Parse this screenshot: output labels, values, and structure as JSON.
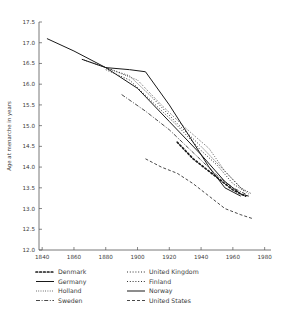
{
  "chart_data": {
    "type": "line",
    "title": "",
    "xlabel": "",
    "ylabel": "Age at menarche in years",
    "xlim": [
      1838,
      1984
    ],
    "ylim": [
      12.0,
      17.5
    ],
    "grid": false,
    "legend_position": "bottom",
    "xticks": [
      1840,
      1860,
      1880,
      1900,
      1920,
      1940,
      1960,
      1980
    ],
    "xtick_labels": [
      "1840",
      "1860",
      "1880",
      "1900",
      "1920",
      "1940",
      "1960",
      "1980"
    ],
    "yticks": [
      12.0,
      12.5,
      13.0,
      13.5,
      14.0,
      14.5,
      15.0,
      15.5,
      16.0,
      16.5,
      17.0,
      17.5
    ],
    "ytick_labels": [
      "12.0",
      "12.5",
      "13.0",
      "13.5",
      "14.0",
      "14.5",
      "15.0",
      "15.5",
      "16.0",
      "16.5",
      "17.0",
      "17.5"
    ],
    "series": [
      {
        "name": "Denmark",
        "style": "dotted-thick",
        "dash": "1.6,2.2",
        "width": 1.7,
        "x": [
          1925,
          1935,
          1945,
          1955,
          1960,
          1965,
          1968
        ],
        "values": [
          14.6,
          14.2,
          13.9,
          13.6,
          13.45,
          13.35,
          13.3
        ]
      },
      {
        "name": "Germany",
        "style": "solid",
        "dash": "none",
        "width": 1.0,
        "x": [
          1865,
          1880,
          1895,
          1905,
          1920,
          1935,
          1945,
          1955,
          1965
        ],
        "values": [
          16.6,
          16.4,
          16.35,
          16.3,
          15.5,
          14.6,
          14.0,
          13.5,
          13.3
        ]
      },
      {
        "name": "Holland",
        "style": "fine-dotted",
        "dash": "0.8,1.5",
        "width": 0.8,
        "x": [
          1865,
          1880,
          1890,
          1900,
          1915,
          1930,
          1945,
          1955,
          1965,
          1970
        ],
        "values": [
          16.6,
          16.4,
          16.25,
          16.1,
          15.5,
          14.95,
          14.45,
          13.9,
          13.5,
          13.35
        ]
      },
      {
        "name": "Sweden",
        "style": "dash-dot",
        "dash": "4,1.6,1,1.6",
        "width": 0.8,
        "x": [
          1890,
          1905,
          1920,
          1935,
          1950,
          1960,
          1968
        ],
        "values": [
          15.75,
          15.35,
          14.9,
          14.35,
          13.8,
          13.5,
          13.35
        ]
      },
      {
        "name": "United Kingdom",
        "style": "dotted",
        "dash": "1.0,1.8",
        "width": 0.9,
        "x": [
          1880,
          1895,
          1910,
          1925,
          1940,
          1955,
          1965,
          1972
        ],
        "values": [
          16.4,
          16.2,
          15.65,
          15.05,
          14.5,
          13.9,
          13.5,
          13.35
        ]
      },
      {
        "name": "Finland",
        "style": "dotted",
        "dash": "1.0,1.8",
        "width": 0.9,
        "x": [
          1880,
          1895,
          1910,
          1925,
          1940,
          1950,
          1960,
          1968
        ],
        "values": [
          16.35,
          16.1,
          15.55,
          15.0,
          14.4,
          14.05,
          13.6,
          13.4
        ]
      },
      {
        "name": "Norway",
        "style": "solid",
        "dash": "none",
        "width": 1.0,
        "x": [
          1843,
          1860,
          1880,
          1900,
          1920,
          1940,
          1955,
          1965,
          1970
        ],
        "values": [
          17.1,
          16.8,
          16.4,
          15.9,
          15.1,
          14.3,
          13.65,
          13.35,
          13.3
        ]
      },
      {
        "name": "United States",
        "style": "dashed",
        "dash": "3,2",
        "width": 0.8,
        "x": [
          1905,
          1915,
          1925,
          1935,
          1945,
          1955,
          1965,
          1973
        ],
        "values": [
          14.2,
          14.0,
          13.85,
          13.6,
          13.3,
          13.0,
          12.85,
          12.75
        ]
      }
    ],
    "legend": {
      "columns": [
        [
          "Denmark",
          "Germany",
          "Holland",
          "Sweden"
        ],
        [
          "United Kingdom",
          "Finland",
          "Norway",
          "United States"
        ]
      ]
    }
  }
}
